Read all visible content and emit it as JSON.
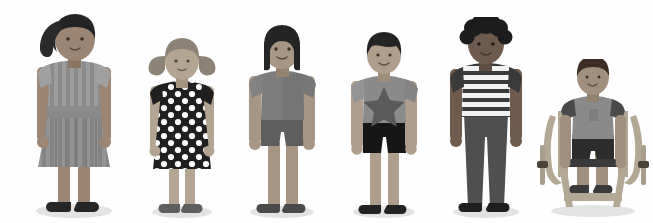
{
  "scene": {
    "title": "Six diverse children standing in a row",
    "background_color": "#fefefe",
    "width": 653,
    "height": 223,
    "shadow_color": "#e3e3e3"
  },
  "palette": {
    "skin_medium_brown": "#9c8573",
    "skin_light_tan": "#b4a593",
    "skin_tan": "#a89684",
    "skin_dark_brown": "#6e5b4e",
    "skin_pale": "#b9ada0",
    "hair_black": "#242424",
    "hair_dark": "#2d2d2d",
    "clothing_gray_mid": "#8f8f8f",
    "clothing_gray_dark": "#6d6d6d",
    "clothing_gray_light": "#a6a6a6",
    "clothing_near_black": "#1f1f1f",
    "stripe_white": "#f2f2f2",
    "dot_white": "#fafafa",
    "shoe_black": "#2a2a2a",
    "wheelchair_frame": "#b3a894",
    "wheelchair_seat": "#3a3a3a",
    "star_gray": "#5a5a5a"
  },
  "figures": [
    {
      "id": "child-1",
      "label": "Girl with ponytail in striped dress",
      "hair": "black ponytail swept to the side",
      "skin": "#9c8573",
      "outfit": "vertically striped long dress with belt",
      "outfit_colors": [
        "#8f8f8f",
        "#a8a8a8"
      ],
      "shoes": "#262626",
      "x": 28,
      "height_px": 208
    },
    {
      "id": "child-2",
      "label": "Girl with pigtails in polka dot dress",
      "hair": "gray pigtails",
      "skin": "#b4a593",
      "outfit": "black dress with white polka dots",
      "outfit_colors": [
        "#1f1f1f",
        "#fafafa"
      ],
      "shoes": "#5e5e5e",
      "x": 140,
      "height_px": 180
    },
    {
      "id": "child-3",
      "label": "Girl with straight dark hair in t-shirt and shorts",
      "hair": "black shoulder-length straight hair",
      "skin": "#a89684",
      "outfit": "gray t-shirt with darker gray shorts",
      "outfit_colors": [
        "#7c7c7c",
        "#5e5e5e"
      ],
      "shoes": "#4a4a4a",
      "x": 238,
      "height_px": 190
    },
    {
      "id": "child-4",
      "label": "Boy with star t-shirt and dark shorts",
      "hair": "short black bowl cut",
      "skin": "#b09e8c",
      "outfit": "gray t-shirt with star graphic and black shorts",
      "outfit_colors": [
        "#8a8a8a",
        "#161616"
      ],
      "graphic": "five-pointed star",
      "shoes": "#222222",
      "x": 340,
      "height_px": 182
    },
    {
      "id": "child-5",
      "label": "Boy with curly hair in striped shirt and dark trousers",
      "hair": "black curly afro",
      "skin": "#6e5b4e",
      "outfit": "horizontally striped shirt with dark trousers",
      "outfit_colors": [
        "#f2f2f2",
        "#3a3a3a",
        "#4f4f4f"
      ],
      "shoes": "#1e1e1e",
      "x": 438,
      "height_px": 198
    },
    {
      "id": "child-6",
      "label": "Boy seated in a wheelchair",
      "hair": "short dark brown hair",
      "skin": "#a2907e",
      "outfit": "gray t-shirt with dark shorts",
      "outfit_colors": [
        "#8a8a8a",
        "#2c2c2c"
      ],
      "shoes": "#3a3a3a",
      "mobility_aid": "manual wheelchair",
      "wheelchair_color": "#b3a894",
      "x": 540,
      "height_px": 150
    }
  ]
}
